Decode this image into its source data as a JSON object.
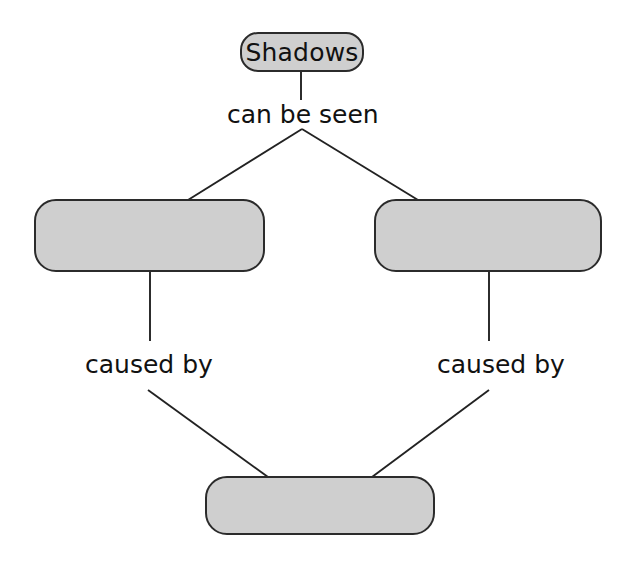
{
  "diagram": {
    "type": "concept-map",
    "background_color": "#ffffff",
    "node_fill_color": "#cfcfcf",
    "node_border_color": "#2b2b2b",
    "text_color": "#111111",
    "nodes": [
      {
        "id": "root",
        "label": "Shadows",
        "filled": true,
        "x": 240,
        "y": 32,
        "w": 124,
        "h": 40
      },
      {
        "id": "effect-left",
        "label": "",
        "filled": false,
        "x": 34,
        "y": 199,
        "w": 231,
        "h": 73
      },
      {
        "id": "effect-right",
        "label": "",
        "filled": false,
        "x": 374,
        "y": 199,
        "w": 228,
        "h": 73
      },
      {
        "id": "cause",
        "label": "",
        "filled": false,
        "x": 205,
        "y": 476,
        "w": 230,
        "h": 59
      }
    ],
    "link_labels": [
      {
        "id": "can-be-seen",
        "text": "can be seen",
        "x": 227,
        "y": 102
      },
      {
        "id": "caused-by-left",
        "text": "caused by",
        "x": 85,
        "y": 352
      },
      {
        "id": "caused-by-right",
        "text": "caused by",
        "x": 437,
        "y": 352
      }
    ],
    "edges": [
      {
        "id": "root-to-can-be-seen",
        "kind": "vertical",
        "points": "301,72 301,100"
      },
      {
        "id": "fork-apex-left",
        "kind": "diagonal",
        "points": "302,129 188,199"
      },
      {
        "id": "fork-apex-right",
        "kind": "diagonal",
        "points": "302,129 418,199"
      },
      {
        "id": "left-node-to-caused-by",
        "kind": "vertical",
        "points": "150,272 150,341"
      },
      {
        "id": "right-node-to-caused-by",
        "kind": "vertical",
        "points": "489,272 489,341"
      },
      {
        "id": "caused-by-left-to-cause",
        "kind": "diagonal",
        "points": "148,390 268,477"
      },
      {
        "id": "caused-by-right-to-cause",
        "kind": "diagonal",
        "points": "489,390 372,477"
      }
    ]
  }
}
